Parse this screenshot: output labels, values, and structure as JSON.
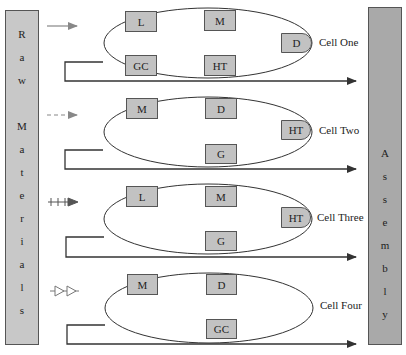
{
  "raw_materials": {
    "label": "Raw Materials",
    "letters": [
      "R",
      "a",
      "w",
      "",
      "M",
      "a",
      "t",
      "e",
      "r",
      "i",
      "a",
      "l",
      "s"
    ]
  },
  "assembly": {
    "label": "Assembly",
    "letters": [
      "A",
      "s",
      "s",
      "e",
      "m",
      "b",
      "l",
      "y"
    ]
  },
  "cells": [
    {
      "name": "Cell One",
      "input_arrow_style": "solid",
      "machines": [
        {
          "label": "L",
          "x": 125,
          "y": 11,
          "w": 32,
          "h": 21
        },
        {
          "label": "M",
          "x": 204,
          "y": 10,
          "w": 32,
          "h": 21
        },
        {
          "label": "D",
          "x": 281,
          "y": 33,
          "w": 31,
          "h": 20
        },
        {
          "label": "GC",
          "x": 125,
          "y": 55,
          "w": 32,
          "h": 21
        },
        {
          "label": "HT",
          "x": 204,
          "y": 55,
          "w": 32,
          "h": 21
        }
      ]
    },
    {
      "name": "Cell Two",
      "input_arrow_style": "dashed",
      "machines": [
        {
          "label": "M",
          "x": 126,
          "y": 98,
          "w": 32,
          "h": 21
        },
        {
          "label": "D",
          "x": 205,
          "y": 98,
          "w": 32,
          "h": 21
        },
        {
          "label": "HT",
          "x": 281,
          "y": 120,
          "w": 30,
          "h": 20
        },
        {
          "label": "G",
          "x": 205,
          "y": 144,
          "w": 32,
          "h": 20
        }
      ]
    },
    {
      "name": "Cell Three",
      "input_arrow_style": "plus",
      "machines": [
        {
          "label": "L",
          "x": 126,
          "y": 186,
          "w": 32,
          "h": 21
        },
        {
          "label": "M",
          "x": 205,
          "y": 186,
          "w": 32,
          "h": 21
        },
        {
          "label": "HT",
          "x": 281,
          "y": 207,
          "w": 30,
          "h": 21
        },
        {
          "label": "G",
          "x": 205,
          "y": 231,
          "w": 32,
          "h": 20
        }
      ]
    },
    {
      "name": "Cell Four",
      "input_arrow_style": "triangles",
      "machines": [
        {
          "label": "M",
          "x": 127,
          "y": 274,
          "w": 31,
          "h": 21
        },
        {
          "label": "D",
          "x": 206,
          "y": 274,
          "w": 31,
          "h": 21
        },
        {
          "label": "GC",
          "x": 206,
          "y": 319,
          "w": 31,
          "h": 20
        }
      ]
    }
  ],
  "colors": {
    "raw_bar": "#c8c8c8",
    "assembly_bar": "#a9a9a9",
    "machine_box": "#c2c2c2",
    "line": "#333333",
    "input_arrow": "#888888"
  }
}
